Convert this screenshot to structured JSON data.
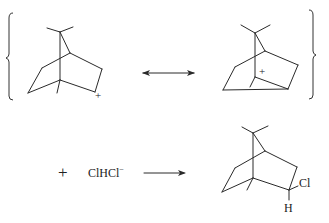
{
  "diagram": {
    "title": "",
    "resonance": {
      "structure_1": {
        "charge_label": "+"
      },
      "arrow": "resonance-double-arrow",
      "structure_2": {
        "charge_label": "+"
      }
    },
    "reaction": {
      "plus_sign": "+",
      "reagent": "ClHCl",
      "reagent_charge": "−",
      "arrow": "reaction-arrow",
      "product": {
        "substituent_1": "Cl",
        "substituent_2": "H"
      }
    }
  }
}
